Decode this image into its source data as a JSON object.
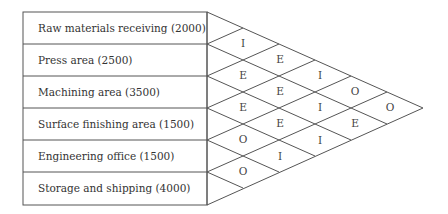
{
  "departments": [
    {
      "name": "Raw materials receiving",
      "area": "2000",
      "label": "Raw materials receiving (2000)"
    },
    {
      "name": "Press area",
      "area": "2500",
      "label": "Press area (2500)"
    },
    {
      "name": "Machining area",
      "area": "3500",
      "label": "Machining area (3500)"
    },
    {
      "name": "Surface finishing area",
      "area": "1500",
      "label": "Surface finishing area (1500)"
    },
    {
      "name": "Engineering office",
      "area": "1500",
      "label": "Engineering office (1500)"
    },
    {
      "name": "Storage and shipping",
      "area": "4000",
      "label": "Storage and shipping (4000)"
    }
  ],
  "relationships": [
    {
      "from": 1,
      "to": 2,
      "code": "I"
    },
    {
      "from": 2,
      "to": 3,
      "code": "E"
    },
    {
      "from": 3,
      "to": 4,
      "code": "E"
    },
    {
      "from": 4,
      "to": 5,
      "code": "O"
    },
    {
      "from": 5,
      "to": 6,
      "code": "O"
    },
    {
      "from": 1,
      "to": 3,
      "code": "E"
    },
    {
      "from": 2,
      "to": 4,
      "code": "E"
    },
    {
      "from": 3,
      "to": 5,
      "code": "E"
    },
    {
      "from": 4,
      "to": 6,
      "code": "I"
    },
    {
      "from": 1,
      "to": 4,
      "code": "I"
    },
    {
      "from": 2,
      "to": 5,
      "code": "I"
    },
    {
      "from": 3,
      "to": 6,
      "code": "I"
    },
    {
      "from": 1,
      "to": 5,
      "code": "O"
    },
    {
      "from": 2,
      "to": 6,
      "code": "E"
    },
    {
      "from": 1,
      "to": 6,
      "code": "O"
    }
  ]
}
